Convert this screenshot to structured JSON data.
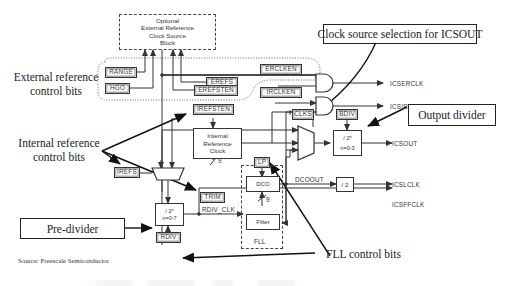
{
  "diagram": {
    "source": "Source: Freescale Semiconductor",
    "caption_truncated": ""
  },
  "blocks": {
    "optional_ext_ref": {
      "line1": "Optional",
      "line2": "External Reference",
      "line3": "Clock Source",
      "line4": "Block"
    },
    "internal_ref_clock": {
      "line1": "Internal",
      "line2": "Reference",
      "line3": "Clock"
    },
    "pre_divider_block": {
      "line1": "/ 2ⁿ",
      "line2": "n=0-7"
    },
    "output_divider_block": {
      "line1": "/ 2ⁿ",
      "line2": "n=0-3"
    },
    "div2_block": {
      "label": "/ 2"
    },
    "dco": {
      "label": "DCO"
    },
    "filter": {
      "label": "Filter"
    },
    "fll_label": "FLL"
  },
  "control_bits": {
    "range": "RANGE",
    "hgo": "HGO",
    "erefs": "EREFS",
    "erefsten": "EREFSTEN",
    "erclken": "ERCLKEN",
    "irclken": "IRCLKEN",
    "irefsten": "IREFSTEN",
    "irefs": "IREFS",
    "trim": "TRIM",
    "rdiv": "RDIV",
    "clks": "CLKS",
    "bdiv": "BDIV",
    "lp": "LP"
  },
  "signals": {
    "icserclk": "ICSERCLK",
    "icsirclk": "ICSIRCLK",
    "icsout": "ICSOUT",
    "icslclk": "ICSLCLK",
    "icsffclk": "ICSFFCLK",
    "dcoout": "DCOOUT",
    "rdiv_clk": "RDIV_CLK",
    "trim_width": "9",
    "filter_width": "9"
  },
  "callouts": {
    "external_ref_line1": "External reference",
    "external_ref_line2": "control bits",
    "internal_ref_line1": "Internal reference",
    "internal_ref_line2": "control bits",
    "clock_source_selection": "Clock source selection for ICSOUT",
    "output_divider": "Output divider",
    "pre_divider": "Pre-divider",
    "fll_control_bits": "FLL control bits"
  },
  "colors": {
    "line": "#333333",
    "callout_text": "#222222",
    "background": "#ffffff"
  }
}
